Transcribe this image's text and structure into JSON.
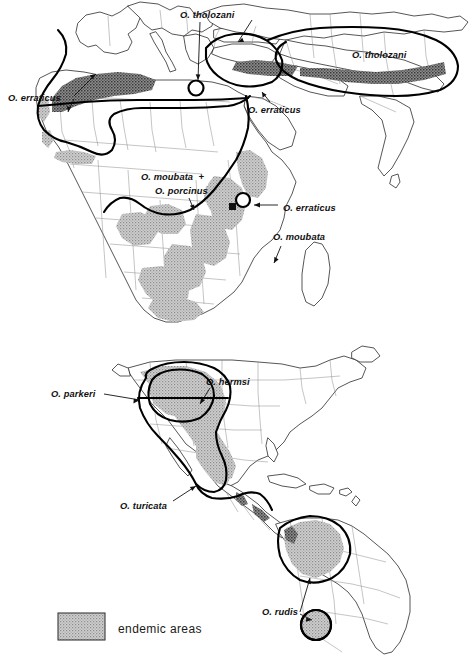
{
  "figure": {
    "background_color": "#ffffff",
    "width": 471,
    "height": 655
  },
  "colors": {
    "endemic_fill": "#b9b9b9",
    "endemic_dark_fill": "#6e6e6e",
    "coast_stroke": "#2b2b2b",
    "border_stroke": "#8a8a8a",
    "range_outline": "#000000",
    "label_color": "#111111",
    "legend_swatch_fill": "#c2c2c2",
    "legend_swatch_stroke": "#3a3a3a"
  },
  "panels": [
    {
      "id": "panel-africa-eurasia",
      "name": "Africa and Eurasia distribution map",
      "labels": [
        {
          "id": "tholozani-med",
          "text": "O. tholozani",
          "x": 180,
          "y": 18
        },
        {
          "id": "tholozani-asia",
          "text": "O. tholozani",
          "x": 352,
          "y": 58
        },
        {
          "id": "erraticus-nwafr",
          "text": "O. erraticus",
          "x": 8,
          "y": 101
        },
        {
          "id": "erraticus-mideast",
          "text": "O. erraticus",
          "x": 248,
          "y": 113
        },
        {
          "id": "moubata",
          "text": "O. moubata  +",
          "x": 141,
          "y": 180
        },
        {
          "id": "porcinus",
          "text": "O. porcinus",
          "x": 155,
          "y": 194
        },
        {
          "id": "erraticus-eafr",
          "text": "O. erraticus",
          "x": 283,
          "y": 211
        },
        {
          "id": "moubata-madag",
          "text": "O. moubata",
          "x": 273,
          "y": 240
        }
      ]
    },
    {
      "id": "panel-americas",
      "name": "Americas distribution map",
      "labels": [
        {
          "id": "parkeri",
          "text": "O. parkeri",
          "x": 51,
          "y": 397
        },
        {
          "id": "hermsi",
          "text": "O. hermsi",
          "x": 206,
          "y": 385
        },
        {
          "id": "turicata",
          "text": "O. turicata",
          "x": 120,
          "y": 509
        },
        {
          "id": "rudis",
          "text": "O. rudis",
          "x": 262,
          "y": 615
        }
      ]
    }
  ],
  "legend": {
    "name": "map-legend",
    "swatch": {
      "x": 58,
      "y": 613,
      "width": 47,
      "height": 27
    },
    "label": "endemic  areas",
    "label_x": 118,
    "label_y": 633
  }
}
